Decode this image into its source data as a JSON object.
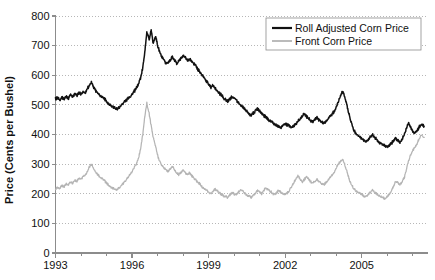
{
  "chart_data": {
    "type": "line",
    "title": "",
    "xlabel": "",
    "ylabel": "Price (Cents per Bushel)",
    "xlim": [
      1993,
      2007.6
    ],
    "ylim": [
      0,
      800
    ],
    "ytick_labels": [
      "800",
      "700",
      "600",
      "500",
      "400",
      "300",
      "200",
      "100",
      "0"
    ],
    "yticks": [
      800,
      700,
      600,
      500,
      400,
      300,
      200,
      100,
      0
    ],
    "xtick_labels": [
      "1993",
      "1996",
      "1999",
      "2002",
      "2005"
    ],
    "xticks": [
      1993,
      1996,
      1999,
      2002,
      2005
    ],
    "xminor_ticks": [
      1994,
      1995,
      1997,
      1998,
      2000,
      2001,
      2003,
      2004,
      2006,
      2007
    ],
    "grid": "horizontal-dotted",
    "legend_position": "top-right",
    "colors": {
      "roll_adjusted": "#111111",
      "front": "#b4b4b4",
      "grid": "#999999",
      "axis": "#8c8c8c",
      "text": "#111111",
      "background": "#ffffff"
    },
    "series": [
      {
        "name": "Roll Adjusted Corn Price",
        "color": "#111111",
        "x": [
          1993.0,
          1993.08,
          1993.17,
          1993.25,
          1993.33,
          1993.42,
          1993.5,
          1993.58,
          1993.67,
          1993.75,
          1993.83,
          1993.92,
          1994.0,
          1994.08,
          1994.17,
          1994.25,
          1994.33,
          1994.42,
          1994.5,
          1994.58,
          1994.67,
          1994.75,
          1994.83,
          1994.92,
          1995.0,
          1995.08,
          1995.17,
          1995.25,
          1995.33,
          1995.42,
          1995.5,
          1995.58,
          1995.67,
          1995.75,
          1995.83,
          1995.92,
          1996.0,
          1996.08,
          1996.17,
          1996.25,
          1996.33,
          1996.42,
          1996.5,
          1996.58,
          1996.67,
          1996.75,
          1996.83,
          1996.92,
          1997.0,
          1997.08,
          1997.17,
          1997.25,
          1997.33,
          1997.42,
          1997.5,
          1997.58,
          1997.67,
          1997.75,
          1997.83,
          1997.92,
          1998.0,
          1998.08,
          1998.17,
          1998.25,
          1998.33,
          1998.42,
          1998.5,
          1998.58,
          1998.67,
          1998.75,
          1998.83,
          1998.92,
          1999.0,
          1999.08,
          1999.17,
          1999.25,
          1999.33,
          1999.42,
          1999.5,
          1999.58,
          1999.67,
          1999.75,
          1999.83,
          1999.92,
          2000.0,
          2000.08,
          2000.17,
          2000.25,
          2000.33,
          2000.42,
          2000.5,
          2000.58,
          2000.67,
          2000.75,
          2000.83,
          2000.92,
          2001.0,
          2001.08,
          2001.17,
          2001.25,
          2001.33,
          2001.42,
          2001.5,
          2001.58,
          2001.67,
          2001.75,
          2001.83,
          2001.92,
          2002.0,
          2002.08,
          2002.17,
          2002.25,
          2002.33,
          2002.42,
          2002.5,
          2002.58,
          2002.67,
          2002.75,
          2002.83,
          2002.92,
          2003.0,
          2003.08,
          2003.17,
          2003.25,
          2003.33,
          2003.42,
          2003.5,
          2003.58,
          2003.67,
          2003.75,
          2003.83,
          2003.92,
          2004.0,
          2004.08,
          2004.17,
          2004.25,
          2004.33,
          2004.42,
          2004.5,
          2004.58,
          2004.67,
          2004.75,
          2004.83,
          2004.92,
          2005.0,
          2005.08,
          2005.17,
          2005.25,
          2005.33,
          2005.42,
          2005.5,
          2005.58,
          2005.67,
          2005.75,
          2005.83,
          2005.92,
          2006.0,
          2006.08,
          2006.17,
          2006.25,
          2006.33,
          2006.42,
          2006.5,
          2006.58,
          2006.67,
          2006.75,
          2006.83,
          2006.92,
          2007.0,
          2007.08,
          2007.17,
          2007.25,
          2007.33,
          2007.45
        ],
        "values": [
          520,
          524,
          516,
          527,
          519,
          530,
          522,
          534,
          526,
          538,
          530,
          542,
          535,
          545,
          540,
          556,
          566,
          575,
          560,
          548,
          540,
          532,
          528,
          520,
          512,
          502,
          496,
          492,
          488,
          486,
          492,
          500,
          508,
          515,
          520,
          528,
          536,
          545,
          556,
          570,
          590,
          625,
          680,
          745,
          720,
          752,
          706,
          735,
          700,
          680,
          660,
          650,
          640,
          644,
          652,
          662,
          650,
          640,
          648,
          658,
          666,
          660,
          650,
          655,
          648,
          640,
          632,
          620,
          610,
          600,
          592,
          580,
          570,
          560,
          566,
          556,
          548,
          540,
          532,
          524,
          516,
          512,
          520,
          528,
          524,
          516,
          508,
          500,
          494,
          486,
          478,
          470,
          466,
          472,
          480,
          488,
          480,
          472,
          464,
          458,
          452,
          446,
          440,
          434,
          430,
          426,
          424,
          430,
          436,
          432,
          428,
          424,
          428,
          436,
          444,
          452,
          462,
          470,
          462,
          454,
          448,
          444,
          450,
          456,
          450,
          444,
          438,
          444,
          452,
          460,
          468,
          478,
          490,
          510,
          530,
          545,
          530,
          500,
          470,
          445,
          420,
          405,
          398,
          392,
          386,
          380,
          376,
          382,
          390,
          398,
          392,
          384,
          376,
          370,
          366,
          362,
          358,
          362,
          370,
          380,
          386,
          380,
          374,
          382,
          398,
          420,
          440,
          425,
          410,
          405,
          412,
          425,
          432,
          428
        ]
      },
      {
        "name": "Front Corn Price",
        "color": "#b4b4b4",
        "x": [
          1993.0,
          1993.08,
          1993.17,
          1993.25,
          1993.33,
          1993.42,
          1993.5,
          1993.58,
          1993.67,
          1993.75,
          1993.83,
          1993.92,
          1994.0,
          1994.08,
          1994.17,
          1994.25,
          1994.33,
          1994.42,
          1994.5,
          1994.58,
          1994.67,
          1994.75,
          1994.83,
          1994.92,
          1995.0,
          1995.08,
          1995.17,
          1995.25,
          1995.33,
          1995.42,
          1995.5,
          1995.58,
          1995.67,
          1995.75,
          1995.83,
          1995.92,
          1996.0,
          1996.08,
          1996.17,
          1996.25,
          1996.33,
          1996.42,
          1996.5,
          1996.58,
          1996.67,
          1996.75,
          1996.83,
          1996.92,
          1997.0,
          1997.08,
          1997.17,
          1997.25,
          1997.33,
          1997.42,
          1997.5,
          1997.58,
          1997.67,
          1997.75,
          1997.83,
          1997.92,
          1998.0,
          1998.08,
          1998.17,
          1998.25,
          1998.33,
          1998.42,
          1998.5,
          1998.58,
          1998.67,
          1998.75,
          1998.83,
          1998.92,
          1999.0,
          1999.08,
          1999.17,
          1999.25,
          1999.33,
          1999.42,
          1999.5,
          1999.58,
          1999.67,
          1999.75,
          1999.83,
          1999.92,
          2000.0,
          2000.08,
          2000.17,
          2000.25,
          2000.33,
          2000.42,
          2000.5,
          2000.58,
          2000.67,
          2000.75,
          2000.83,
          2000.92,
          2001.0,
          2001.08,
          2001.17,
          2001.25,
          2001.33,
          2001.42,
          2001.5,
          2001.58,
          2001.67,
          2001.75,
          2001.83,
          2001.92,
          2002.0,
          2002.08,
          2002.17,
          2002.25,
          2002.33,
          2002.42,
          2002.5,
          2002.58,
          2002.67,
          2002.75,
          2002.83,
          2002.92,
          2003.0,
          2003.08,
          2003.17,
          2003.25,
          2003.33,
          2003.42,
          2003.5,
          2003.58,
          2003.67,
          2003.75,
          2003.83,
          2003.92,
          2004.0,
          2004.08,
          2004.17,
          2004.25,
          2004.33,
          2004.42,
          2004.5,
          2004.58,
          2004.67,
          2004.75,
          2004.83,
          2004.92,
          2005.0,
          2005.08,
          2005.17,
          2005.25,
          2005.33,
          2005.42,
          2005.5,
          2005.58,
          2005.67,
          2005.75,
          2005.83,
          2005.92,
          2006.0,
          2006.08,
          2006.17,
          2006.25,
          2006.33,
          2006.42,
          2006.5,
          2006.58,
          2006.67,
          2006.75,
          2006.83,
          2006.92,
          2007.0,
          2007.08,
          2007.17,
          2007.25,
          2007.33,
          2007.45
        ],
        "values": [
          216,
          222,
          218,
          228,
          224,
          234,
          230,
          240,
          236,
          246,
          242,
          252,
          248,
          258,
          262,
          276,
          292,
          300,
          284,
          272,
          264,
          256,
          252,
          244,
          236,
          228,
          222,
          218,
          216,
          214,
          220,
          228,
          236,
          246,
          254,
          264,
          274,
          286,
          300,
          320,
          350,
          400,
          460,
          505,
          470,
          430,
          390,
          360,
          330,
          310,
          295,
          288,
          280,
          276,
          284,
          292,
          280,
          270,
          265,
          272,
          280,
          272,
          264,
          270,
          262,
          254,
          246,
          238,
          232,
          224,
          218,
          212,
          206,
          200,
          208,
          216,
          210,
          204,
          198,
          194,
          190,
          188,
          196,
          204,
          200,
          196,
          206,
          214,
          208,
          202,
          196,
          192,
          188,
          194,
          202,
          210,
          206,
          200,
          212,
          220,
          214,
          208,
          202,
          198,
          204,
          212,
          206,
          200,
          198,
          202,
          212,
          224,
          236,
          250,
          262,
          250,
          240,
          248,
          256,
          250,
          240,
          236,
          242,
          248,
          242,
          236,
          230,
          236,
          244,
          252,
          262,
          272,
          286,
          300,
          310,
          316,
          300,
          276,
          252,
          234,
          220,
          212,
          206,
          202,
          198,
          194,
          190,
          196,
          204,
          212,
          206,
          200,
          194,
          190,
          186,
          184,
          190,
          198,
          210,
          226,
          242,
          236,
          230,
          240,
          254,
          280,
          310,
          330,
          345,
          355,
          368,
          385,
          398,
          390
        ]
      }
    ]
  },
  "legend": {
    "entries": [
      {
        "label": "Roll Adjusted Corn Price",
        "color": "#111111",
        "width": 2.2
      },
      {
        "label": "Front Corn Price",
        "color": "#b4b4b4",
        "width": 1.6
      }
    ]
  }
}
